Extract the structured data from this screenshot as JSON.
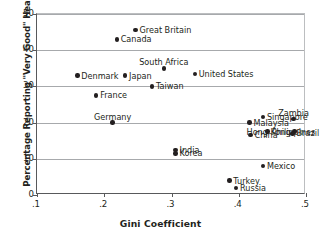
{
  "chart_data": {
    "type": "scatter",
    "title": "",
    "xlabel": "Gini Coefficient",
    "ylabel": "Percentage Reporting \"Very Good\" Health",
    "xlim": [
      0.1,
      0.5
    ],
    "ylim": [
      0,
      50
    ],
    "xticks": [
      ".1",
      ".2",
      ".3",
      ".4",
      ".5"
    ],
    "xtick_values": [
      0.1,
      0.2,
      0.3,
      0.4,
      0.5
    ],
    "yticks": [
      "0",
      "10",
      "20",
      "30",
      "40",
      "50"
    ],
    "ytick_values": [
      0,
      10,
      20,
      30,
      40,
      50
    ],
    "grid": "horizontal",
    "legend": "none",
    "points": [
      {
        "label": "Great Britain",
        "x": 0.2465,
        "y": 45.5,
        "lab_pos": "right"
      },
      {
        "label": "Canada",
        "x": 0.2185,
        "y": 43.0,
        "lab_pos": "right"
      },
      {
        "label": "South Africa",
        "x": 0.2885,
        "y": 35.0,
        "lab_pos": "top"
      },
      {
        "label": "United States",
        "x": 0.3345,
        "y": 33.5,
        "lab_pos": "right"
      },
      {
        "label": "Denmark",
        "x": 0.16,
        "y": 33.0,
        "lab_pos": "right"
      },
      {
        "label": "Japan",
        "x": 0.231,
        "y": 33.0,
        "lab_pos": "right"
      },
      {
        "label": "Taiwan",
        "x": 0.271,
        "y": 30.0,
        "lab_pos": "right"
      },
      {
        "label": "France",
        "x": 0.188,
        "y": 27.5,
        "lab_pos": "right"
      },
      {
        "label": "Germany",
        "x": 0.2125,
        "y": 20.0,
        "lab_pos": "top"
      },
      {
        "label": "Singapore",
        "x": 0.436,
        "y": 21.5,
        "lab_pos": "right"
      },
      {
        "label": "Zambia",
        "x": 0.4815,
        "y": 21.0,
        "lab_pos": "top"
      },
      {
        "label": "Malaysia",
        "x": 0.416,
        "y": 20.0,
        "lab_pos": "right"
      },
      {
        "label": "Philippines",
        "x": 0.443,
        "y": 17.5,
        "lab_pos": "right"
      },
      {
        "label": "Hong Kong",
        "x": 0.483,
        "y": 17.5,
        "lab_pos": "left"
      },
      {
        "label": "Brazil",
        "x": 0.48,
        "y": 17.0,
        "lab_pos": "right"
      },
      {
        "label": "China",
        "x": 0.4175,
        "y": 16.5,
        "lab_pos": "right"
      },
      {
        "label": "India",
        "x": 0.306,
        "y": 12.5,
        "lab_pos": "right"
      },
      {
        "label": "Korea",
        "x": 0.306,
        "y": 11.5,
        "lab_pos": "right"
      },
      {
        "label": "Mexico",
        "x": 0.436,
        "y": 8.0,
        "lab_pos": "right"
      },
      {
        "label": "Turkey",
        "x": 0.386,
        "y": 4.0,
        "lab_pos": "right"
      },
      {
        "label": "Russia",
        "x": 0.396,
        "y": 2.0,
        "lab_pos": "right"
      }
    ],
    "colors": {
      "point": "#231f20",
      "text": "#231f20",
      "gridline": "#a7a9ac",
      "axis": "#58595b",
      "background": "#ffffff"
    }
  }
}
